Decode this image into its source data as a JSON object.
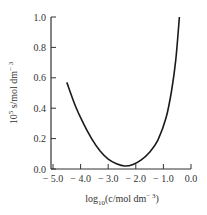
{
  "chart_data": {
    "type": "line",
    "title": "",
    "xlabel": "log10(c/mol dm^-3)",
    "ylabel": "10^5 s/mol dm^-3",
    "xlim": [
      -5.0,
      0.0
    ],
    "ylim": [
      0.0,
      1.0
    ],
    "grid": false,
    "legend": null,
    "x_ticks": [
      "-5.0",
      "-4.0",
      "-3.0",
      "-2.0",
      "-1.0",
      "0.0"
    ],
    "y_ticks": [
      "0.0",
      "0.2",
      "0.4",
      "0.6",
      "0.8",
      "1.0"
    ],
    "series": [
      {
        "name": "solubility",
        "x": [
          -4.5,
          -4.2,
          -3.9,
          -3.6,
          -3.3,
          -3.0,
          -2.7,
          -2.4,
          -2.1,
          -1.8,
          -1.5,
          -1.2,
          -0.9,
          -0.7,
          -0.55,
          -0.42
        ],
        "y": [
          0.57,
          0.42,
          0.3,
          0.2,
          0.12,
          0.065,
          0.035,
          0.02,
          0.03,
          0.06,
          0.11,
          0.19,
          0.34,
          0.52,
          0.72,
          1.0
        ]
      }
    ]
  },
  "labels": {
    "xlabel_main": "log",
    "xlabel_sub": "10",
    "xlabel_rest": "(c/mol dm",
    "xlabel_sup": "− 3",
    "xlabel_end": ")",
    "ylabel_main": "10",
    "ylabel_sup": "5",
    "ylabel_rest": " s/mol dm",
    "ylabel_sup2": "− 3"
  }
}
